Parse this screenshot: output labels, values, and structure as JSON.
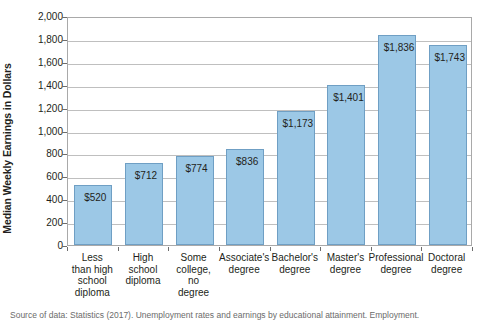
{
  "chart_data": {
    "type": "bar",
    "title": "",
    "xlabel": "",
    "ylabel": "Median Weekly Earnings in Dollars",
    "ylim": [
      0,
      2000
    ],
    "ytick_step": 200,
    "grid": true,
    "legend": "none",
    "bar_color": "#9cc8e6",
    "bar_border_color": "#6f9fc4",
    "categories": [
      "Less than high school diploma",
      "High school diploma",
      "Some college, no degree",
      "Associate's degree",
      "Bachelor's degree",
      "Master's degree",
      "Professional degree",
      "Doctoral degree"
    ],
    "category_lines": [
      [
        "Less",
        "than high",
        "school",
        "diploma"
      ],
      [
        "High",
        "school",
        "diploma"
      ],
      [
        "Some",
        "college,",
        "no",
        "degree"
      ],
      [
        "Associate's",
        "degree"
      ],
      [
        "Bachelor's",
        "degree"
      ],
      [
        "Master's",
        "degree"
      ],
      [
        "Professional",
        "degree"
      ],
      [
        "Doctoral",
        "degree"
      ]
    ],
    "values": [
      520,
      712,
      774,
      836,
      1173,
      1401,
      1836,
      1743
    ],
    "data_labels": [
      "$520",
      "$712",
      "$774",
      "$836",
      "$1,173",
      "$1,401",
      "$1,836",
      "$1,743"
    ],
    "ytick_labels": [
      "0",
      "200",
      "400",
      "600",
      "800",
      "1,000",
      "1,200",
      "1,400",
      "1,600",
      "1,800",
      "2,000"
    ],
    "ytick_values": [
      0,
      200,
      400,
      600,
      800,
      1000,
      1200,
      1400,
      1600,
      1800,
      2000
    ]
  },
  "caption": "Source of data: Statistics (2017). Unemployment rates and earnings by educational attainment. Employment."
}
